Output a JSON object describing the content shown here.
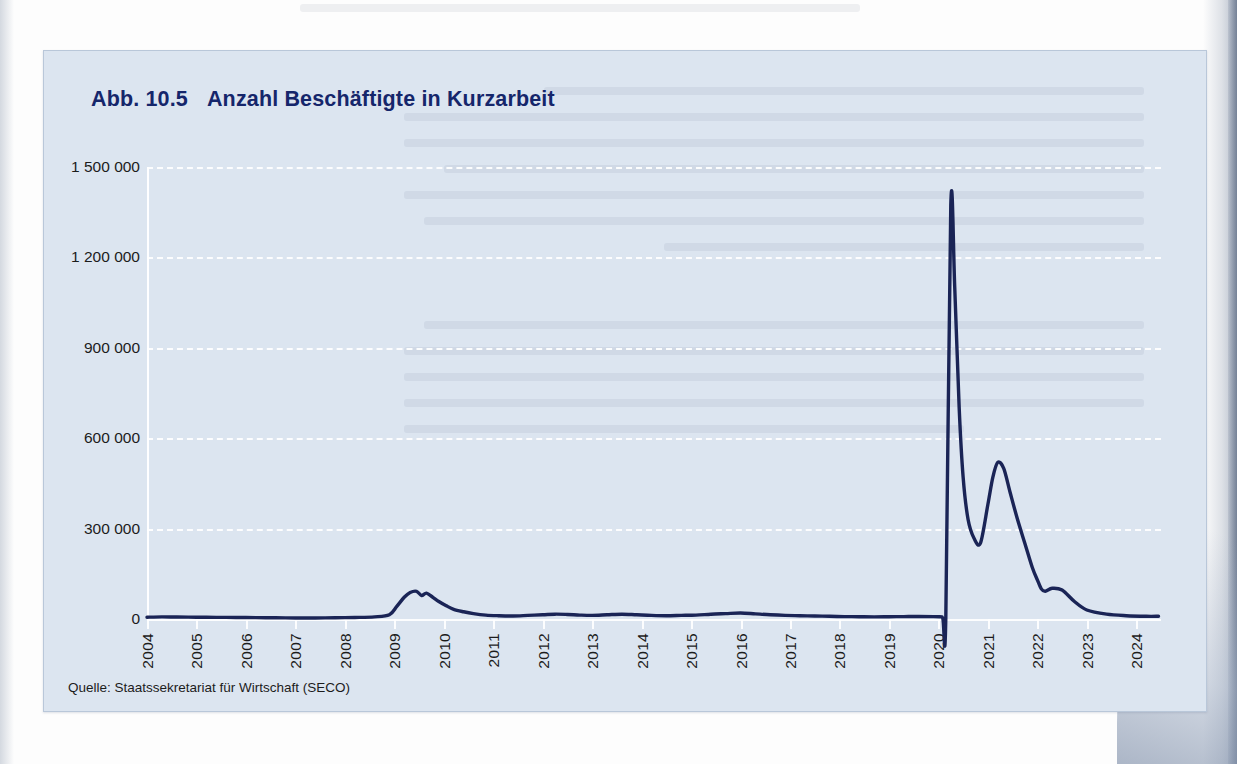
{
  "figure": {
    "number_label": "Abb. 10.5",
    "title": "Anzahl Beschäftigte in Kurzarbeit",
    "source": "Quelle: Staatssekretariat für Wirtschaft (SECO)",
    "colors": {
      "card_background": "#dce5f0",
      "card_border": "#b9c7d9",
      "title": "#15266b",
      "series_line": "#1a2456",
      "gridline": "#ffffff",
      "axis_text": "#1c1c1c",
      "page_background": "#fdfdfd"
    }
  },
  "chart_data": {
    "type": "line",
    "subtitle": "",
    "xlabel": "",
    "ylabel": "",
    "source": "Quelle: Staatssekretariat für Wirtschaft (SECO)",
    "grid": true,
    "grid_style": "dashed-horizontal",
    "legend": "none",
    "xlim": [
      2004,
      2024.5
    ],
    "ylim": [
      0,
      1500000
    ],
    "yticks": [
      0,
      300000,
      600000,
      900000,
      1200000,
      1500000
    ],
    "ytick_labels": [
      "0",
      "300 000",
      "600 000",
      "900 000",
      "1 200 000",
      "1 500 000"
    ],
    "xticks": [
      2004,
      2005,
      2006,
      2007,
      2008,
      2009,
      2010,
      2011,
      2012,
      2013,
      2014,
      2015,
      2016,
      2017,
      2018,
      2019,
      2020,
      2021,
      2022,
      2023,
      2024
    ],
    "xtick_labels": [
      "2004",
      "2005",
      "2006",
      "2007",
      "2008",
      "2009",
      "2010",
      "2011",
      "2012",
      "2013",
      "2014",
      "2015",
      "2016",
      "2017",
      "2018",
      "2019",
      "2020",
      "2021",
      "2022",
      "2023",
      "2024"
    ],
    "xtick_rotation": 90,
    "series": [
      {
        "name": "Beschäftigte in Kurzarbeit",
        "color": "#1a2456",
        "line_width": 3.4,
        "x": [
          2004.0,
          2004.3,
          2004.6,
          2005.0,
          2005.4,
          2005.8,
          2006.2,
          2006.6,
          2007.0,
          2007.4,
          2007.8,
          2008.2,
          2008.6,
          2008.9,
          2009.05,
          2009.2,
          2009.32,
          2009.45,
          2009.55,
          2009.65,
          2009.78,
          2009.9,
          2010.05,
          2010.2,
          2010.4,
          2010.6,
          2010.85,
          2011.1,
          2011.4,
          2011.7,
          2012.0,
          2012.25,
          2012.5,
          2012.75,
          2013.0,
          2013.3,
          2013.6,
          2013.9,
          2014.2,
          2014.5,
          2014.8,
          2015.1,
          2015.4,
          2015.7,
          2016.0,
          2016.3,
          2016.6,
          2016.9,
          2017.2,
          2017.5,
          2017.8,
          2018.1,
          2018.4,
          2018.7,
          2019.0,
          2019.3,
          2019.6,
          2019.9,
          2020.08,
          2020.15,
          2020.25,
          2020.33,
          2020.42,
          2020.5,
          2020.6,
          2020.72,
          2020.85,
          2021.0,
          2021.1,
          2021.2,
          2021.32,
          2021.45,
          2021.6,
          2021.75,
          2021.9,
          2022.0,
          2022.08,
          2022.16,
          2022.3,
          2022.5,
          2022.75,
          2023.0,
          2023.4,
          2023.8,
          2024.2,
          2024.45
        ],
        "y": [
          6000,
          7000,
          6500,
          6000,
          5500,
          5000,
          4500,
          4000,
          3500,
          3500,
          4000,
          5000,
          7000,
          14000,
          42000,
          72000,
          88000,
          92000,
          78000,
          86000,
          72000,
          58000,
          44000,
          32000,
          24000,
          18000,
          13000,
          11000,
          10000,
          12000,
          14000,
          16000,
          15000,
          13000,
          12000,
          14000,
          16000,
          14000,
          12000,
          11000,
          12000,
          13000,
          16000,
          18000,
          20000,
          17000,
          14000,
          12000,
          11000,
          10000,
          9000,
          8000,
          7500,
          7000,
          7500,
          8000,
          8500,
          8000,
          7000,
          7000,
          1372000,
          1100000,
          700000,
          470000,
          330000,
          268000,
          252000,
          380000,
          470000,
          520000,
          500000,
          420000,
          330000,
          250000,
          170000,
          130000,
          100000,
          92000,
          102000,
          96000,
          58000,
          30000,
          16000,
          11000,
          9000,
          9000
        ],
        "key_points": [
          {
            "label": "COVID peak",
            "x": 2020.25,
            "y": 1372000
          },
          {
            "label": "2nd wave peak",
            "x": 2021.2,
            "y": 520000
          },
          {
            "label": "summer 2020 trough",
            "x": 2020.85,
            "y": 252000
          },
          {
            "label": "financial crisis peak",
            "x": 2009.45,
            "y": 92000
          }
        ]
      }
    ]
  }
}
